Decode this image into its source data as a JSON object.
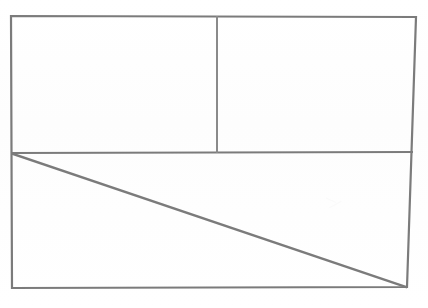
{
  "document": {
    "title": "Rectangle divided into three regions with a diagonal",
    "type": "line-drawing",
    "medium": "scanned monochrome line art",
    "background_color": "#ffffff",
    "line_color": "#7b7b7b",
    "line_color_secondary": "#8a8a8a",
    "canvas": {
      "width": 428,
      "height": 308
    },
    "text_labels": [],
    "annotations": []
  },
  "figure": {
    "outer_rectangle": {
      "name": "outer-frame",
      "description": "Large rectangle enclosing the whole figure",
      "top_left": {
        "x": 11,
        "y": 16
      },
      "top_right": {
        "x": 416,
        "y": 17
      },
      "bottom_right": {
        "x": 407,
        "y": 287
      },
      "bottom_left": {
        "x": 12,
        "y": 288
      },
      "stroke_width": 2.2,
      "stroke": "#7b7b7b"
    },
    "horizontal_divider": {
      "name": "horizontal-divider",
      "description": "Full-width horizontal line splitting the rectangle into an upper band and a lower band",
      "start": {
        "x": 11,
        "y": 153
      },
      "end": {
        "x": 413,
        "y": 152
      },
      "stroke_width": 2.2,
      "stroke": "#7b7b7b"
    },
    "vertical_divider": {
      "name": "vertical-divider",
      "description": "Vertical line inside the upper band only, splitting it into a left cell and a right cell",
      "start": {
        "x": 217,
        "y": 16
      },
      "end": {
        "x": 217,
        "y": 153
      },
      "stroke_width": 2.0,
      "stroke": "#8a8a8a"
    },
    "diagonal": {
      "name": "diagonal-line",
      "description": "Diagonal running from the left end of the horizontal divider down to the bottom-right corner of the rectangle",
      "start": {
        "x": 13,
        "y": 154
      },
      "end": {
        "x": 406,
        "y": 287
      },
      "stroke_width": 2.4,
      "stroke": "#7b7b7b"
    },
    "faint_mark": {
      "name": "faint-scan-artifact",
      "description": "Very faint smudge in the lower-right region of the lower band",
      "x": 326,
      "y": 196,
      "width": 22,
      "height": 18,
      "color": "#fafafa"
    },
    "regions": [
      {
        "name": "upper-left-cell",
        "label": "",
        "bounds": {
          "x": 11,
          "y": 16,
          "width": 206,
          "height": 137
        }
      },
      {
        "name": "upper-right-cell",
        "label": "",
        "bounds": {
          "x": 217,
          "y": 16,
          "width": 199,
          "height": 137
        }
      },
      {
        "name": "lower-band",
        "label": "",
        "bounds": {
          "x": 11,
          "y": 153,
          "width": 402,
          "height": 135
        }
      },
      {
        "name": "lower-upper-triangle",
        "label": "",
        "description": "Triangle above the diagonal inside the lower band"
      },
      {
        "name": "lower-lower-triangle",
        "label": "",
        "description": "Triangle below the diagonal inside the lower band"
      }
    ]
  }
}
